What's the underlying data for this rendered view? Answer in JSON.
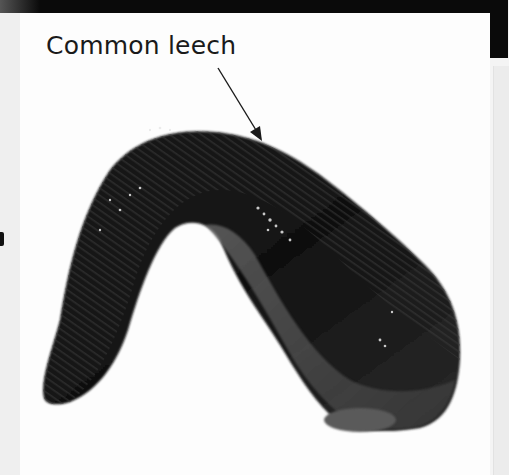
{
  "figure": {
    "label": "Common leech",
    "pointer": "arrow-pointer",
    "colors": {
      "background": "#fdfdfd",
      "top_bar": "#0a0a0a",
      "text": "#1a1a1a",
      "leech_dark": "#151515",
      "leech_mid": "#555555"
    }
  }
}
